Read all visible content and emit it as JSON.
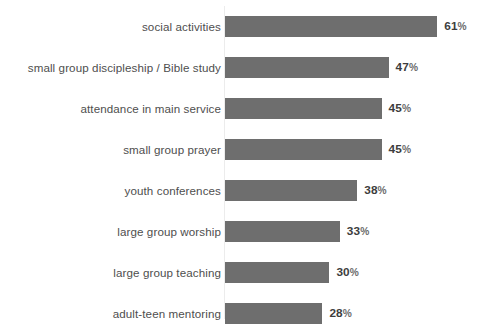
{
  "chart_data": {
    "type": "bar",
    "orientation": "horizontal",
    "title": "",
    "subtitle": "",
    "xlabel": "",
    "ylabel": "",
    "xlim": [
      0,
      61
    ],
    "grid": false,
    "legend": null,
    "value_suffix": "%",
    "categories": [
      "social activities",
      "small group discipleship / Bible study",
      "attendance in main service",
      "small group prayer",
      "youth conferences",
      "large group worship",
      "large group teaching",
      "adult-teen mentoring"
    ],
    "values": [
      61,
      47,
      45,
      45,
      38,
      33,
      30,
      28
    ],
    "value_labels": [
      "61%",
      "47%",
      "45%",
      "45%",
      "38%",
      "33%",
      "30%",
      "28%"
    ],
    "bars": [
      {
        "label": "social activities",
        "value": 61,
        "value_text": "61",
        "suffix": "%"
      },
      {
        "label": "small group discipleship / Bible study",
        "value": 47,
        "value_text": "47",
        "suffix": "%"
      },
      {
        "label": "attendance in main service",
        "value": 45,
        "value_text": "45",
        "suffix": "%"
      },
      {
        "label": "small group prayer",
        "value": 45,
        "value_text": "45",
        "suffix": "%"
      },
      {
        "label": "youth conferences",
        "value": 38,
        "value_text": "38",
        "suffix": "%"
      },
      {
        "label": "large group worship",
        "value": 33,
        "value_text": "33",
        "suffix": "%"
      },
      {
        "label": "large group teaching",
        "value": 30,
        "value_text": "30",
        "suffix": "%"
      },
      {
        "label": "adult-teen mentoring",
        "value": 28,
        "value_text": "28",
        "suffix": "%"
      }
    ]
  },
  "style": {
    "bar_color": "#6e6e6e",
    "label_color": "#4e4e4e",
    "value_color": "#3d3d3d",
    "percent_sign_color": "#6b6b6b",
    "background_color": "#ffffff",
    "axis_line_color": "#ececec"
  },
  "geometry": {
    "origin_x": 225,
    "px_per_unit": 3.48,
    "bar_height": 21,
    "row_pitch": 41,
    "first_row_top": 16,
    "value_gap": 7
  }
}
